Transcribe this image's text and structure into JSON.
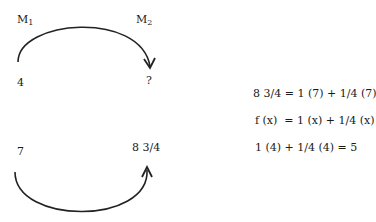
{
  "diagram": {
    "machines": {
      "m1": {
        "base": "M",
        "sub": "1"
      },
      "m2": {
        "base": "M",
        "sub": "2"
      }
    },
    "top_row": {
      "input": "4",
      "output": "?"
    },
    "bottom_row": {
      "input": "7",
      "output": "8 3/4"
    },
    "arrows": [
      {
        "name": "top-arc-arrow",
        "from": "4",
        "to": "?",
        "direction": "over, pointing down"
      },
      {
        "name": "bottom-arc-arrow",
        "from": "7",
        "to": "8 3/4",
        "direction": "under, pointing up"
      }
    ],
    "stroke_color": "#222222"
  },
  "equations": [
    "8 3/4 = 1 (7) + 1/4 (7)",
    "f (x)  = 1 (x) + 1/4 (x)",
    "1 (4) + 1/4 (4) = 5"
  ]
}
